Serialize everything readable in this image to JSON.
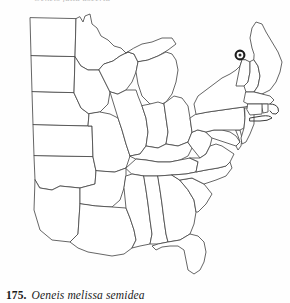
{
  "plate": {
    "cut_off_caption_above": "Oeneis jutta ascerta",
    "caption": {
      "number": "175.",
      "species_name": "Oeneis melissa semidea"
    }
  },
  "map": {
    "title": "Oeneis melissa semidea distribution map",
    "region": "Eastern and central United States",
    "projection_note": "state outline map",
    "colors": {
      "background": "#ffffff",
      "state_border": "#4a4a4a",
      "coastline": "#3a3a3a",
      "record_marker": "#1d1d1d"
    },
    "records": [
      {
        "label": "New Hampshire — White Mountains",
        "marker": "filled-circle",
        "x": 240,
        "y": 51,
        "radius": 4.4
      }
    ],
    "states": [
      "North Dakota",
      "South Dakota",
      "Nebraska",
      "Kansas",
      "Minnesota",
      "Iowa",
      "Missouri",
      "Arkansas",
      "Louisiana",
      "Wisconsin",
      "Illinois",
      "Mississippi",
      "Michigan",
      "Indiana",
      "Ohio",
      "Kentucky",
      "Tennessee",
      "Alabama",
      "Georgia",
      "Florida",
      "South Carolina",
      "North Carolina",
      "Virginia",
      "West Virginia",
      "Maryland",
      "Delaware",
      "Pennsylvania",
      "New Jersey",
      "New York",
      "Connecticut",
      "Rhode Island",
      "Massachusetts",
      "Vermont",
      "New Hampshire",
      "Maine"
    ]
  }
}
